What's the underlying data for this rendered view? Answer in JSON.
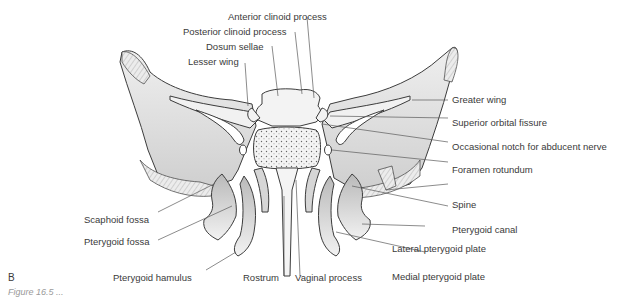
{
  "figure": {
    "panel_letter": "B",
    "caption": "Figure 16.5 ...",
    "colors": {
      "bone_fill": "#e4e4e4",
      "bone_shadow": "#bdbdbd",
      "outline": "#3c3c3c",
      "leader_line": "#5a5a5a",
      "label_text": "#3a3a3a",
      "background": "#ffffff"
    }
  },
  "labels": {
    "anterior_clinoid_process": "Anterior clinoid process",
    "posterior_clinoid_process": "Posterior clinoid process",
    "dosum_sellae": "Dosum sellae",
    "lesser_wing": "Lesser wing",
    "greater_wing": "Greater wing",
    "superior_orbital_fissure": "Superior orbital fissure",
    "occasional_notch": "Occasional notch for abducent nerve",
    "foramen_rotundum": "Foramen rotundum",
    "spine": "Spine",
    "pterygoid_canal": "Pterygoid canal",
    "lateral_pterygoid_plate": "Lateral pterygoid plate",
    "medial_pterygoid_plate": "Medial pterygoid plate",
    "scaphoid_fossa": "Scaphoid fossa",
    "pterygoid_fossa": "Pterygoid fossa",
    "pterygoid_hamulus": "Pterygoid hamulus",
    "rostrum": "Rostrum",
    "vaginal_process": "Vaginal process"
  }
}
